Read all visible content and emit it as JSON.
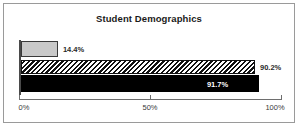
{
  "chart_data": {
    "type": "bar",
    "orientation": "horizontal",
    "title": "Student Demographics",
    "xlabel": "",
    "ylabel": "",
    "xlim": [
      0,
      100
    ],
    "grid": false,
    "legend": "none",
    "tick_labels": [
      "0%",
      "50%",
      "100%"
    ],
    "tick_values": [
      0,
      50,
      100
    ],
    "categories": [
      "",
      "",
      ""
    ],
    "values": [
      14.4,
      90.2,
      91.7
    ],
    "data_labels": [
      "14.4%",
      "90.2%",
      "91.7%"
    ],
    "series": [
      {
        "name": "bar-1",
        "value": 14.4,
        "label": "14.4%",
        "fill": "#c9c9c9",
        "pattern": "solid-gray",
        "label_position": "outside"
      },
      {
        "name": "bar-2",
        "value": 90.2,
        "label": "90.2%",
        "fill": "#ffffff",
        "pattern": "diagonal-hatch",
        "label_position": "outside"
      },
      {
        "name": "bar-3",
        "value": 91.7,
        "label": "91.7%",
        "fill": "#000000",
        "pattern": "solid-black",
        "label_position": "inside"
      }
    ]
  },
  "colors": {
    "frame_border": "#9a9a9a",
    "axis": "#6e6e6e",
    "title_text": "#1a1a1a",
    "tick_text": "#3a3a3a",
    "bar_gray": "#c9c9c9",
    "bar_black": "#000000",
    "bar_outline": "#111111",
    "inside_label_text": "#ffffff"
  }
}
